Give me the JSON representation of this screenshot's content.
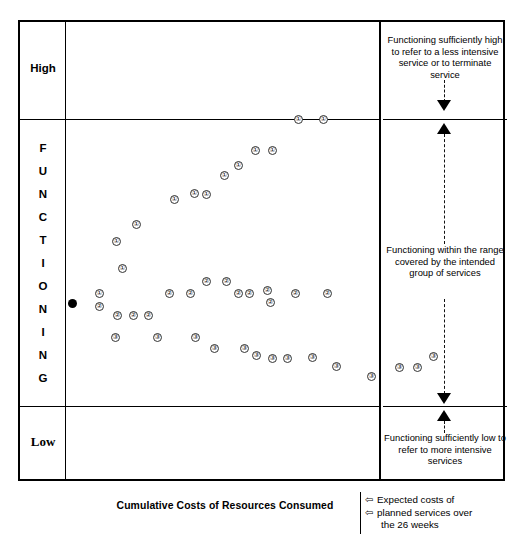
{
  "axes": {
    "y_high_label": "High",
    "y_low_label": "Low",
    "y_axis_title_letters": [
      "F",
      "U",
      "N",
      "C",
      "T",
      "I",
      "O",
      "N",
      "I",
      "N",
      "G"
    ],
    "y_axis_title": "FUNCTIONING",
    "x_axis_title": "Cumulative Costs of Resources Consumed"
  },
  "right_panel": {
    "high_band_text": "Functioning sufficiently high to refer to a less intensive service or to terminate service",
    "mid_band_text": "Functioning within the range covered by the intended group of services",
    "low_band_text": "Functioning sufficiently low to refer to more intensive services"
  },
  "legend": {
    "arrow_glyph": "⇦",
    "line1": "Expected costs of",
    "line2": "planned services over",
    "line3": "the 26 weeks"
  },
  "chart_data": {
    "type": "scatter",
    "title": "",
    "xlabel": "Cumulative Costs of Resources Consumed",
    "ylabel": "FUNCTIONING",
    "ytick_labels": [
      "High",
      "Low"
    ],
    "bands": [
      {
        "name": "High",
        "y_range_px": [
          0,
          97
        ]
      },
      {
        "name": "Intended range",
        "y_range_px": [
          97,
          384
        ]
      },
      {
        "name": "Low",
        "y_range_px": [
          384,
          459
        ]
      }
    ],
    "grid": false,
    "legend_position": "bottom-right",
    "annotations": [
      "Functioning sufficiently high to refer to a less intensive service or to terminate service",
      "Functioning within the range covered by the intended group of services",
      "Functioning sufficiently low to refer to more intensive services",
      "Expected costs of planned services over the 26 weeks"
    ],
    "origin_marker": {
      "label": "baseline",
      "x": 72,
      "y": 303
    },
    "series": [
      {
        "name": "1",
        "marker_label": "①",
        "points": [
          {
            "x": 99,
            "y": 293
          },
          {
            "x": 122,
            "y": 268
          },
          {
            "x": 116,
            "y": 241
          },
          {
            "x": 136,
            "y": 224
          },
          {
            "x": 174,
            "y": 199
          },
          {
            "x": 194,
            "y": 193
          },
          {
            "x": 206,
            "y": 194
          },
          {
            "x": 224,
            "y": 175
          },
          {
            "x": 238,
            "y": 165
          },
          {
            "x": 255,
            "y": 150
          },
          {
            "x": 272,
            "y": 150
          },
          {
            "x": 298,
            "y": 119
          },
          {
            "x": 323,
            "y": 119
          }
        ]
      },
      {
        "name": "2",
        "marker_label": "②",
        "points": [
          {
            "x": 99,
            "y": 306
          },
          {
            "x": 117,
            "y": 315
          },
          {
            "x": 133,
            "y": 315
          },
          {
            "x": 148,
            "y": 315
          },
          {
            "x": 169,
            "y": 293
          },
          {
            "x": 190,
            "y": 293
          },
          {
            "x": 206,
            "y": 281
          },
          {
            "x": 226,
            "y": 281
          },
          {
            "x": 238,
            "y": 293
          },
          {
            "x": 249,
            "y": 293
          },
          {
            "x": 267,
            "y": 290
          },
          {
            "x": 270,
            "y": 302
          },
          {
            "x": 295,
            "y": 293
          },
          {
            "x": 327,
            "y": 293
          }
        ]
      },
      {
        "name": "3",
        "marker_label": "③",
        "points": [
          {
            "x": 115,
            "y": 337
          },
          {
            "x": 157,
            "y": 337
          },
          {
            "x": 195,
            "y": 337
          },
          {
            "x": 214,
            "y": 348
          },
          {
            "x": 244,
            "y": 348
          },
          {
            "x": 256,
            "y": 355
          },
          {
            "x": 272,
            "y": 358
          },
          {
            "x": 287,
            "y": 358
          },
          {
            "x": 312,
            "y": 357
          },
          {
            "x": 336,
            "y": 366
          },
          {
            "x": 371,
            "y": 376
          }
        ]
      },
      {
        "name": "3-right-panel",
        "marker_label": "③",
        "points": [
          {
            "x": 399,
            "y": 367
          },
          {
            "x": 417,
            "y": 367
          },
          {
            "x": 433,
            "y": 356
          }
        ]
      }
    ]
  }
}
